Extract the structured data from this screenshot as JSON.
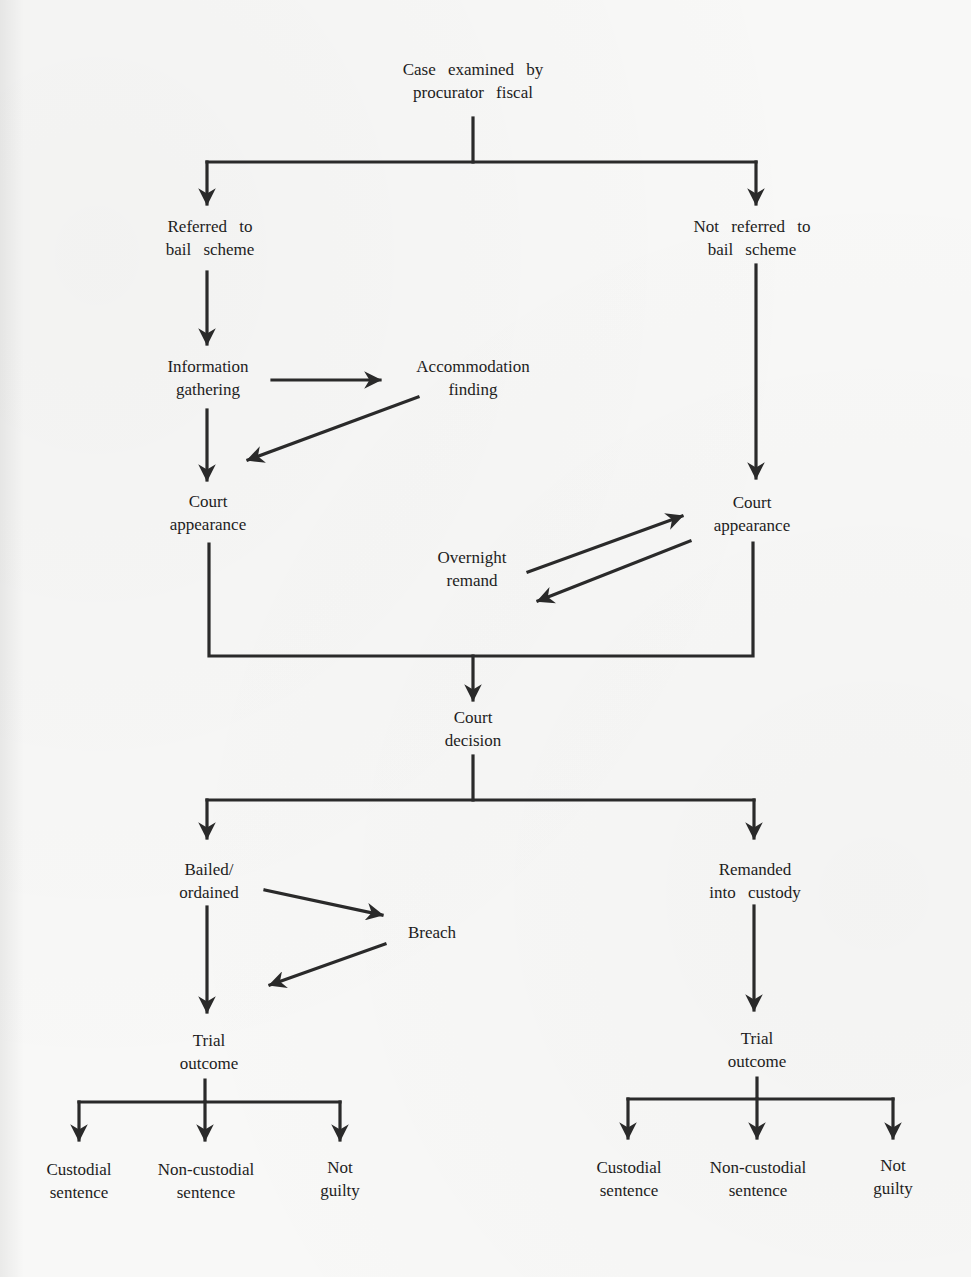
{
  "diagram": {
    "type": "flowchart",
    "title": "",
    "nodes": {
      "case_examined": {
        "line1": "Case examined by",
        "line2": "procurator fiscal"
      },
      "referred": {
        "line1": "Referred to",
        "line2": "bail scheme"
      },
      "not_referred": {
        "line1": "Not referred to",
        "line2": "bail scheme"
      },
      "info_gathering": {
        "line1": "Information",
        "line2": "gathering"
      },
      "accommodation": {
        "line1": "Accommodation",
        "line2": "finding"
      },
      "court_appearance_left": {
        "line1": "Court",
        "line2": "appearance"
      },
      "court_appearance_right": {
        "line1": "Court",
        "line2": "appearance"
      },
      "overnight_remand": {
        "line1": "Overnight",
        "line2": "remand"
      },
      "court_decision": {
        "line1": "Court",
        "line2": "decision"
      },
      "bailed": {
        "line1": "Bailed/",
        "line2": "ordained"
      },
      "remanded": {
        "line1": "Remanded",
        "line2": "into custody"
      },
      "breach": {
        "line1": "Breach",
        "line2": ""
      },
      "trial_outcome_left": {
        "line1": "Trial",
        "line2": "outcome"
      },
      "trial_outcome_right": {
        "line1": "Trial",
        "line2": "outcome"
      },
      "custodial_left": {
        "line1": "Custodial",
        "line2": "sentence"
      },
      "noncustodial_left": {
        "line1": "Non-custodial",
        "line2": "sentence"
      },
      "notguilty_left": {
        "line1": "Not",
        "line2": "guilty"
      },
      "custodial_right": {
        "line1": "Custodial",
        "line2": "sentence"
      },
      "noncustodial_right": {
        "line1": "Non-custodial",
        "line2": "sentence"
      },
      "notguilty_right": {
        "line1": "Not",
        "line2": "guilty"
      }
    },
    "edges": [
      [
        "case_examined",
        "referred"
      ],
      [
        "case_examined",
        "not_referred"
      ],
      [
        "referred",
        "info_gathering"
      ],
      [
        "info_gathering",
        "accommodation"
      ],
      [
        "accommodation",
        "court_appearance_left"
      ],
      [
        "info_gathering",
        "court_appearance_left"
      ],
      [
        "not_referred",
        "court_appearance_right"
      ],
      [
        "overnight_remand",
        "court_appearance_right"
      ],
      [
        "court_appearance_right",
        "overnight_remand"
      ],
      [
        "court_appearance_left",
        "court_decision"
      ],
      [
        "court_appearance_right",
        "court_decision"
      ],
      [
        "court_decision",
        "bailed"
      ],
      [
        "court_decision",
        "remanded"
      ],
      [
        "bailed",
        "breach"
      ],
      [
        "breach",
        "trial_outcome_left"
      ],
      [
        "bailed",
        "trial_outcome_left"
      ],
      [
        "remanded",
        "trial_outcome_right"
      ],
      [
        "trial_outcome_left",
        "custodial_left"
      ],
      [
        "trial_outcome_left",
        "noncustodial_left"
      ],
      [
        "trial_outcome_left",
        "notguilty_left"
      ],
      [
        "trial_outcome_right",
        "custodial_right"
      ],
      [
        "trial_outcome_right",
        "noncustodial_right"
      ],
      [
        "trial_outcome_right",
        "notguilty_right"
      ]
    ],
    "colors": {
      "line": "#2a2a2a",
      "background": "#f8f8f7",
      "text": "#1d1d1d"
    }
  }
}
